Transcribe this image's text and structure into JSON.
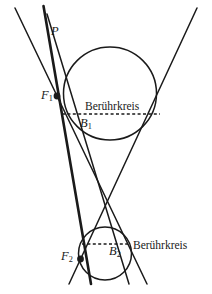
{
  "figure": {
    "type": "geometry-diagram",
    "background_color": "#ffffff",
    "stroke_color": "#1a1a1a",
    "labels": {
      "p": "P",
      "f1_letter": "F",
      "f1_sub": "1",
      "f2_letter": "F",
      "f2_sub": "2",
      "b1_letter": "B",
      "b1_sub": "1",
      "b2_letter": "B",
      "b2_sub": "2",
      "beruehrkreis_upper": "Berührkreis",
      "beruehrkreis_lower": "Berührkreis"
    },
    "geometry": {
      "upper_circle": {
        "cx": 110,
        "cy": 93.5,
        "r": 46.5
      },
      "lower_circle": {
        "cx": 105,
        "cy": 253.5,
        "r": 26.5
      },
      "upper_chord": {
        "x1": 62,
        "y1": 114,
        "x2": 160,
        "y2": 114
      },
      "lower_chord": {
        "x1": 82,
        "y1": 244,
        "x2": 129,
        "y2": 244
      },
      "point_f1": {
        "x": 57,
        "y": 96
      },
      "point_f2": {
        "x": 80.5,
        "y": 259
      },
      "point_p": {
        "x": 48,
        "y": 28
      },
      "cone_left_edge": {
        "x1": 15,
        "y1": 8,
        "x2": 145,
        "y2": 284
      },
      "cone_right_edge": {
        "x1": 196,
        "y1": 8,
        "x2": 70,
        "y2": 284
      },
      "secant_line_1": {
        "x1": 44,
        "y1": 8,
        "x2": 90,
        "y2": 284
      },
      "secant_line_2": {
        "x1": 47,
        "y1": 16,
        "x2": 128,
        "y2": 284
      }
    }
  }
}
